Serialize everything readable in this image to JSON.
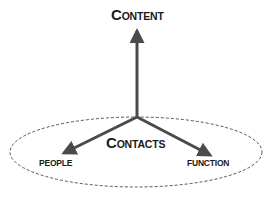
{
  "diagram": {
    "type": "three-axis diagram with ellipse",
    "labels": {
      "content": {
        "first": "C",
        "rest": "ONTENT",
        "full": "Content"
      },
      "contacts": {
        "first": "C",
        "rest": "ONTACTS",
        "full": "Contacts"
      },
      "people": "PEOPLE",
      "function": "FUNCTION"
    },
    "colors": {
      "arrow": "#4a4a4a",
      "ellipse": "#555555",
      "text": "#1a1a1a",
      "background": "#ffffff"
    },
    "ellipse_style": "dashed",
    "arrows": [
      {
        "from": "origin",
        "to": "Content",
        "direction": "up"
      },
      {
        "from": "origin",
        "to": "People",
        "direction": "down-left"
      },
      {
        "from": "origin",
        "to": "Function",
        "direction": "down-right"
      }
    ]
  }
}
